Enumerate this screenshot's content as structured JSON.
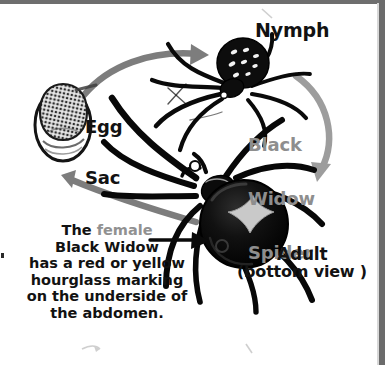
{
  "diagram": {
    "subject": "Black Widow Spider",
    "type": "life-cycle-illustration",
    "background_color": "#ffffff",
    "ink_color": "#121212",
    "accent_gray": "#8e8e8e",
    "arrow_gray": "#7d7d7d",
    "hourglass_color": "#c9c9c9"
  },
  "labels": {
    "nymph": "Nymph",
    "egg_sac_line1": "Egg",
    "egg_sac_line2": "Sac",
    "species_line1": "Black",
    "species_line2": "Widow",
    "species_line3": "Spider",
    "adult": "Adult",
    "adult_view": "(bottom view )"
  },
  "caption": {
    "line1_prefix": "The ",
    "line1_highlight": "female",
    "line2": "Black Widow",
    "line3": "has a red or yellow",
    "line4": "hourglass marking",
    "line5": "on the underside of",
    "line6": "the abdomen."
  },
  "stages": [
    {
      "name": "egg-sac",
      "label": "Egg Sac"
    },
    {
      "name": "nymph",
      "label": "Nymph"
    },
    {
      "name": "adult",
      "label": "Adult (bottom view )"
    }
  ],
  "arrows": [
    {
      "name": "eggsac-to-nymph",
      "color": "#7d7d7d",
      "direction": "right"
    },
    {
      "name": "nymph-to-adult",
      "color": "#9a9a9a",
      "direction": "down"
    },
    {
      "name": "adult-to-eggsac",
      "color": "#7d7d7d",
      "direction": "left"
    },
    {
      "name": "caption-pointer",
      "color": "#121212",
      "direction": "right"
    }
  ]
}
